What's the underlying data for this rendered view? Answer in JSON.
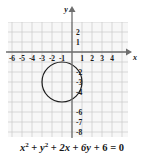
{
  "figure": {
    "title_equation_plain": "x^2 + y^2 + 2x + 6y + 6 = 0",
    "caption": {
      "term1": "x",
      "term1_exp": "2",
      "plus1": " + ",
      "term2": "y",
      "term2_exp": "2",
      "plus2": " + ",
      "term3": "2x",
      "plus3": " + ",
      "term4": "6y",
      "plus4": " + ",
      "term5": "6",
      "equals": " = ",
      "rhs": "0"
    },
    "axes": {
      "x_label": "x",
      "y_label": "y",
      "x_ticks": [
        "-6",
        "-5",
        "-4",
        "-3",
        "-2",
        "-1",
        "1",
        "2",
        "3",
        "4"
      ],
      "x_tick_values": [
        -6,
        -5,
        -4,
        -3,
        -2,
        -1,
        1,
        2,
        3,
        4
      ],
      "y_ticks": [
        "2",
        "1",
        "-2",
        "-3",
        "-4",
        "-6",
        "-7",
        "-8"
      ],
      "y_tick_values": [
        2,
        1,
        -2,
        -3,
        -4,
        -6,
        -7,
        -8
      ],
      "x_range": [
        -6.4,
        5.6
      ],
      "y_range": [
        -8.5,
        3.0
      ],
      "axis_color": "#6e6e6e",
      "grid_major_color": "#c9c9c9",
      "grid_minor_color": "#e6e6e6",
      "minor_divisions": 5
    },
    "circle": {
      "center_x": -1,
      "center_y": -3,
      "radius": 2,
      "stroke_color": "#1c1c1c",
      "stroke_width": 1.2,
      "fill": "none"
    }
  }
}
